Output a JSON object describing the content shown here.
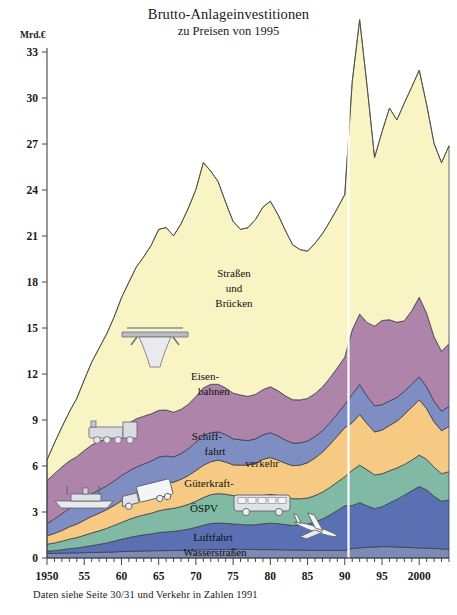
{
  "header": {
    "title": "Brutto-Anlageinvestitionen",
    "subtitle": "zu Preisen von 1995",
    "unit": "Mrd.€"
  },
  "footnote": "Daten siehe Seite 30/31 und Verkehr in Zahlen 1991",
  "labels": {
    "strassen_1": "Straßen",
    "strassen_2": "und",
    "strassen_3": "Brücken",
    "eisen_1": "Eisen-",
    "eisen_2": "bahnen",
    "schiff_1": "Schiff-",
    "schiff_2": "fahrt",
    "gueter_1": "Güterkraft-",
    "gueter_2": "verkehr",
    "oespv": "ÖSPV",
    "luftfahrt": "Luftfahrt",
    "wasserstrassen": "Wasserstraßen"
  },
  "icons": [
    {
      "name": "highway-bridge-icon",
      "x": 155,
      "y": 340
    },
    {
      "name": "steam-locomotive-icon",
      "x": 113,
      "y": 432
    },
    {
      "name": "ship-icon",
      "x": 85,
      "y": 499
    },
    {
      "name": "truck-icon",
      "x": 145,
      "y": 497
    },
    {
      "name": "bus-icon",
      "x": 262,
      "y": 505
    },
    {
      "name": "airplane-icon",
      "x": 315,
      "y": 529
    }
  ],
  "colors": {
    "strassen_und_bruecken": "#F8F4C4",
    "eisenbahnen": "#AE84AA",
    "schifffahrt": "#7E8DC2",
    "gueterkraftverkehr": "#F6CA82",
    "oespv": "#80B9A4",
    "luftfahrt": "#5A70B2",
    "wasserstrassen": "#7C8AB6",
    "divider": "#FFFFFF",
    "axis": "#444444"
  },
  "chart_data": {
    "type": "area",
    "title": "Brutto-Anlageinvestitionen",
    "subtitle": "zu Preisen von 1995",
    "xlabel": "",
    "ylabel": "Mrd.€",
    "ylim": [
      0,
      33
    ],
    "ytick_values": [
      0,
      3,
      6,
      9,
      12,
      15,
      18,
      21,
      24,
      27,
      30,
      33
    ],
    "xlim": [
      1950,
      2004
    ],
    "xtick_labels": [
      "1950",
      "55",
      "60",
      "65",
      "70",
      "75",
      "80",
      "85",
      "90",
      "95",
      "2000"
    ],
    "xtick_values": [
      1950,
      1955,
      1960,
      1965,
      1970,
      1975,
      1980,
      1985,
      1990,
      1995,
      2000
    ],
    "grid": false,
    "legend": "inline-area-labels",
    "annotations": [
      {
        "text": "Reihenbruch 1991: Gesamtdeutschland",
        "x": 1990.5,
        "type": "vertical-divider"
      }
    ],
    "stacking": "bottom-to-top",
    "x": [
      1950,
      1951,
      1952,
      1953,
      1954,
      1955,
      1956,
      1957,
      1958,
      1959,
      1960,
      1961,
      1962,
      1963,
      1964,
      1965,
      1966,
      1967,
      1968,
      1969,
      1970,
      1971,
      1972,
      1973,
      1974,
      1975,
      1976,
      1977,
      1978,
      1979,
      1980,
      1981,
      1982,
      1983,
      1984,
      1985,
      1986,
      1987,
      1988,
      1989,
      1990,
      1991,
      1992,
      1993,
      1994,
      1995,
      1996,
      1997,
      1998,
      1999,
      2000,
      2001,
      2002,
      2003,
      2004
    ],
    "series": [
      {
        "name": "Wasserstraßen",
        "color": "#7C8AB6",
        "values": [
          0.3,
          0.3,
          0.32,
          0.33,
          0.33,
          0.35,
          0.36,
          0.37,
          0.38,
          0.4,
          0.42,
          0.43,
          0.45,
          0.46,
          0.47,
          0.48,
          0.48,
          0.49,
          0.5,
          0.5,
          0.52,
          0.54,
          0.55,
          0.56,
          0.56,
          0.57,
          0.57,
          0.56,
          0.55,
          0.55,
          0.55,
          0.54,
          0.53,
          0.52,
          0.52,
          0.51,
          0.5,
          0.5,
          0.5,
          0.5,
          0.5,
          0.62,
          0.66,
          0.7,
          0.72,
          0.74,
          0.74,
          0.72,
          0.7,
          0.68,
          0.66,
          0.64,
          0.62,
          0.6,
          0.58
        ]
      },
      {
        "name": "Luftfahrt",
        "color": "#5A70B2",
        "values": [
          0.15,
          0.18,
          0.22,
          0.28,
          0.32,
          0.38,
          0.45,
          0.52,
          0.6,
          0.7,
          0.8,
          0.9,
          0.98,
          1.05,
          1.1,
          1.18,
          1.22,
          1.25,
          1.3,
          1.38,
          1.48,
          1.6,
          1.7,
          1.72,
          1.7,
          1.65,
          1.62,
          1.6,
          1.62,
          1.68,
          1.72,
          1.7,
          1.65,
          1.6,
          1.62,
          1.7,
          1.85,
          2.05,
          2.3,
          2.6,
          2.9,
          2.8,
          2.95,
          2.7,
          2.5,
          2.6,
          2.85,
          3.1,
          3.4,
          3.7,
          4.0,
          3.8,
          3.4,
          3.1,
          3.2
        ]
      },
      {
        "name": "ÖSPV",
        "color": "#80B9A4",
        "values": [
          0.45,
          0.5,
          0.55,
          0.62,
          0.68,
          0.75,
          0.82,
          0.88,
          0.95,
          1.02,
          1.1,
          1.18,
          1.25,
          1.3,
          1.35,
          1.42,
          1.48,
          1.5,
          1.55,
          1.62,
          1.7,
          1.8,
          1.88,
          1.92,
          1.9,
          1.85,
          1.82,
          1.8,
          1.82,
          1.85,
          1.88,
          1.85,
          1.8,
          1.75,
          1.72,
          1.7,
          1.72,
          1.75,
          1.8,
          1.85,
          1.9,
          2.3,
          2.45,
          2.35,
          2.2,
          2.15,
          2.1,
          2.05,
          2.0,
          2.0,
          2.05,
          2.0,
          1.9,
          1.8,
          1.85
        ]
      },
      {
        "name": "Güterkraftverkehr",
        "color": "#F6CA82",
        "values": [
          0.55,
          0.62,
          0.7,
          0.8,
          0.88,
          0.98,
          1.08,
          1.15,
          1.22,
          1.3,
          1.4,
          1.48,
          1.55,
          1.6,
          1.65,
          1.72,
          1.75,
          1.7,
          1.78,
          1.88,
          2.0,
          2.1,
          2.15,
          2.18,
          2.1,
          2.0,
          2.05,
          2.1,
          2.2,
          2.35,
          2.4,
          2.3,
          2.2,
          2.15,
          2.2,
          2.3,
          2.45,
          2.6,
          2.8,
          3.0,
          3.2,
          3.1,
          3.3,
          3.0,
          2.8,
          2.85,
          2.95,
          3.05,
          3.25,
          3.45,
          3.6,
          3.3,
          2.95,
          2.8,
          2.95
        ]
      },
      {
        "name": "Schifffahrt",
        "color": "#7E8DC2",
        "values": [
          0.8,
          0.95,
          1.1,
          1.2,
          1.28,
          1.4,
          1.48,
          1.52,
          1.55,
          1.6,
          1.65,
          1.68,
          1.7,
          1.72,
          1.75,
          1.78,
          1.72,
          1.65,
          1.68,
          1.75,
          1.85,
          1.95,
          1.9,
          1.85,
          1.78,
          1.7,
          1.65,
          1.6,
          1.58,
          1.6,
          1.62,
          1.58,
          1.52,
          1.48,
          1.45,
          1.42,
          1.4,
          1.4,
          1.42,
          1.45,
          1.5,
          1.85,
          1.95,
          1.8,
          1.7,
          1.65,
          1.6,
          1.55,
          1.52,
          1.5,
          1.5,
          1.42,
          1.35,
          1.28,
          1.3
        ]
      },
      {
        "name": "Eisenbahnen",
        "color": "#AE84AA",
        "values": [
          2.8,
          2.95,
          3.05,
          3.1,
          3.12,
          3.15,
          3.18,
          3.15,
          3.1,
          3.08,
          3.1,
          3.12,
          3.15,
          3.12,
          3.08,
          3.05,
          3.0,
          2.92,
          2.88,
          2.9,
          2.98,
          3.1,
          3.15,
          3.1,
          3.05,
          2.98,
          2.92,
          2.88,
          2.9,
          2.95,
          3.0,
          2.95,
          2.88,
          2.82,
          2.8,
          2.78,
          2.8,
          2.85,
          2.92,
          3.0,
          3.1,
          4.2,
          4.6,
          4.8,
          5.2,
          5.5,
          5.3,
          4.9,
          4.6,
          4.8,
          5.2,
          4.8,
          4.2,
          3.9,
          4.1
        ]
      },
      {
        "name": "Straßen und Brücken",
        "color": "#F8F4C4",
        "values": [
          1.35,
          2.0,
          2.6,
          3.2,
          3.8,
          4.6,
          5.4,
          6.1,
          6.8,
          7.6,
          8.5,
          9.2,
          9.9,
          10.4,
          11.0,
          11.8,
          11.9,
          11.5,
          12.1,
          12.8,
          13.5,
          14.7,
          13.9,
          13.2,
          12.1,
          11.2,
          10.8,
          11.0,
          11.4,
          11.9,
          12.1,
          11.5,
          10.8,
          10.1,
          9.8,
          9.6,
          9.8,
          10.0,
          10.2,
          10.4,
          10.6,
          16.2,
          19.2,
          15.4,
          11.0,
          12.3,
          13.8,
          13.2,
          14.2,
          14.6,
          14.8,
          13.6,
          12.6,
          12.3,
          12.9
        ]
      }
    ],
    "total_top_values": [
      6.4,
      7.5,
      8.54,
      9.53,
      10.41,
      11.61,
      12.77,
      13.69,
      14.6,
      15.7,
      16.97,
      17.99,
      18.98,
      19.65,
      20.4,
      21.43,
      21.55,
      20.91,
      21.79,
      22.83,
      24.03,
      25.79,
      25.23,
      24.53,
      23.19,
      21.95,
      21.43,
      21.44,
      22.07,
      22.88,
      23.27,
      22.42,
      21.38,
      20.42,
      20.11,
      20.01,
      20.52,
      21.15,
      21.96,
      22.8,
      23.7,
      31.07,
      35.11,
      30.75,
      26.12,
      27.79,
      29.34,
      28.57,
      29.67,
      30.73,
      31.81,
      29.56,
      26.92,
      25.78,
      26.88
    ]
  }
}
